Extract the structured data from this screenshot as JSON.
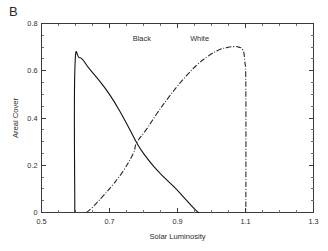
{
  "figure": {
    "panel_label": "B",
    "background": "#ffffff",
    "ink": "#1a1a1a"
  },
  "chart_data": {
    "type": "line",
    "title": "",
    "panel": "B",
    "xlabel": "Solar Luminosity",
    "ylabel": "Areal Cover",
    "xlim": [
      0.5,
      1.3
    ],
    "ylim": [
      0.0,
      0.8
    ],
    "xticks": [
      0.5,
      0.7,
      0.9,
      1.1,
      1.3
    ],
    "xticklabels": [
      "0.5",
      "0.7",
      "0.9",
      "1.1",
      "1.3"
    ],
    "yticks": [
      0.0,
      0.2,
      0.4,
      0.6,
      0.8
    ],
    "yticklabels": [
      "0",
      "0.2",
      "0.4",
      "0.6",
      "0.8"
    ],
    "x_minor_tick_step": 0.05,
    "y_minor_tick_step": 0.05,
    "grid": false,
    "legend": "inline-annotations",
    "frame": "box",
    "series": [
      {
        "name": "Black",
        "label": "Black",
        "style": "solid",
        "color": "#111111",
        "annotation": {
          "text": "Black",
          "x": 0.795,
          "y": 0.725
        },
        "x": [
          0.598,
          0.598,
          0.612,
          0.64,
          0.67,
          0.7,
          0.73,
          0.76,
          0.78,
          0.8,
          0.83,
          0.86,
          0.89,
          0.92,
          0.94,
          0.955,
          0.962,
          0.962
        ],
        "values": [
          0.0,
          0.6,
          0.655,
          0.61,
          0.558,
          0.5,
          0.43,
          0.35,
          0.295,
          0.25,
          0.195,
          0.15,
          0.108,
          0.062,
          0.03,
          0.008,
          0.0,
          0.0
        ]
      },
      {
        "name": "White",
        "label": "White",
        "style": "dash-dot",
        "color": "#2a2a2a",
        "annotation": {
          "text": "White",
          "x": 0.965,
          "y": 0.726
        },
        "x": [
          0.632,
          0.65,
          0.68,
          0.71,
          0.74,
          0.77,
          0.78,
          0.81,
          0.84,
          0.87,
          0.9,
          0.93,
          0.96,
          0.99,
          1.02,
          1.045,
          1.065,
          1.08,
          1.092,
          1.098,
          1.101,
          1.101
        ],
        "values": [
          0.0,
          0.022,
          0.068,
          0.118,
          0.175,
          0.25,
          0.295,
          0.355,
          0.42,
          0.48,
          0.535,
          0.585,
          0.628,
          0.662,
          0.687,
          0.698,
          0.702,
          0.7,
          0.688,
          0.64,
          0.52,
          0.0
        ]
      }
    ],
    "annotations": [
      {
        "name": "crossing-point",
        "x": 0.78,
        "y": 0.295,
        "text": ""
      }
    ]
  }
}
